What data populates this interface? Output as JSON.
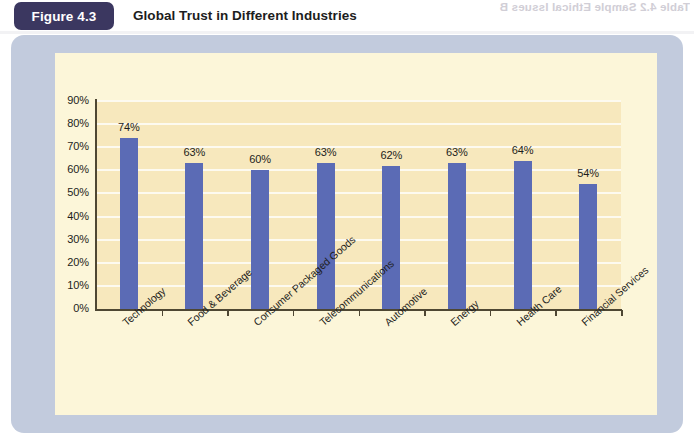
{
  "figure": {
    "badge_label": "Figure 4.3",
    "title": "Global Trust in Different Industries"
  },
  "artifact": {
    "bleed_top_text": "Table 4.2    Sample Ethical Issues B",
    "bleed_plot_text": "Sample Ethical Issues"
  },
  "colors": {
    "badge_bg": "#3b3760",
    "bar": "#5b6bb5",
    "panel": "#c2cbdd",
    "canvas": "#fcf6d9",
    "plotband": "#f7e8bd",
    "gridline": "#fdfaf0",
    "axis": "#4e4733",
    "text": "#1d1d20"
  },
  "chart_data": {
    "type": "bar",
    "title": "Global Trust in Different Industries",
    "xlabel": "",
    "ylabel": "",
    "ylim": [
      0,
      90
    ],
    "ytick_labels": [
      "0%",
      "10%",
      "20%",
      "30%",
      "40%",
      "50%",
      "60%",
      "70%",
      "80%",
      "90%"
    ],
    "ytick_values": [
      0,
      10,
      20,
      30,
      40,
      50,
      60,
      70,
      80,
      90
    ],
    "grid": true,
    "legend": "none",
    "categories": [
      "Technology",
      "Food & Beverage",
      "Consumer Packaged Goods",
      "Telecommunications",
      "Automotive",
      "Energy",
      "Health Care",
      "Financial Services"
    ],
    "values": [
      74,
      63,
      60,
      63,
      62,
      63,
      64,
      54
    ],
    "value_labels": [
      "74%",
      "63%",
      "60%",
      "63%",
      "62%",
      "63%",
      "64%",
      "54%"
    ]
  }
}
